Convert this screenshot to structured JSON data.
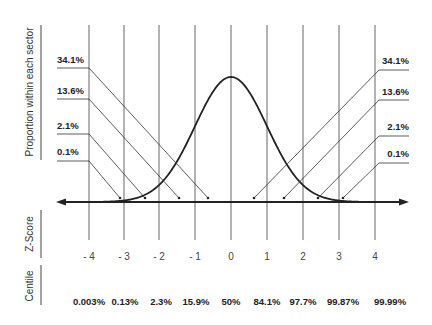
{
  "side_labels": {
    "proportion": "Proportion within each sector",
    "zscore": "Z-Score",
    "centile": "Centile"
  },
  "left_percentages": [
    "34.1%",
    "13.6%",
    "2.1%",
    "0.1%"
  ],
  "right_percentages": [
    "34.1%",
    "13.6%",
    "2.1%",
    "0.1%"
  ],
  "z_scores": [
    "- 4",
    "- 3",
    "- 2",
    "- 1",
    "0",
    "1",
    "2",
    "3",
    "4"
  ],
  "centiles": [
    "0.003%",
    "0.13%",
    "2.3%",
    "15.9%",
    "50%",
    "84.1%",
    "97.7%",
    "99.87%",
    "99.99%"
  ],
  "colors": {
    "line": "#222222",
    "grid": "#555555",
    "text": "#222222"
  }
}
